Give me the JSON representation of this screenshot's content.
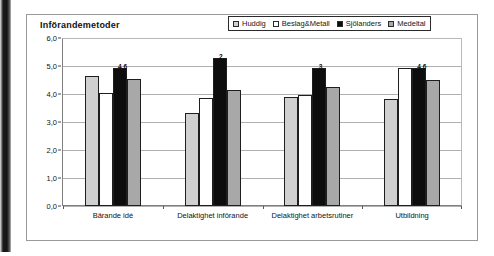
{
  "chart_data": {
    "type": "bar",
    "title": "Införandemetoder",
    "xlabel": "",
    "ylabel": "",
    "ylim": [
      0.0,
      6.0
    ],
    "ytick_step": 1.0,
    "grid": true,
    "legend_position": "top-right",
    "ytick_labels": [
      "6,0",
      "5,0",
      "4,0",
      "3,0",
      "2,0",
      "1,0",
      "0,0"
    ],
    "categories": [
      "Bärande idé",
      "Delaktighet införande",
      "Delaktighet arbetsrutiner",
      "Utbildning"
    ],
    "series": [
      {
        "name": "Huddig",
        "color": "#d0d0d0",
        "values": [
          4.7,
          3.35,
          3.95,
          3.85
        ],
        "labels": [
          "",
          "",
          "",
          ""
        ]
      },
      {
        "name": "Beslag&Metall",
        "color": "#ffffff",
        "values": [
          4.1,
          3.9,
          4.0,
          5.0
        ],
        "labels": [
          "",
          "",
          "",
          ""
        ]
      },
      {
        "name": "Sjölanders",
        "color": "#0d0d0d",
        "values": [
          5.0,
          5.35,
          5.0,
          5.0
        ],
        "labels": [
          "4,6",
          "2",
          "3",
          "4,6"
        ]
      },
      {
        "name": "Medeltal",
        "color": "#a8a8a8",
        "values": [
          4.6,
          4.2,
          4.3,
          4.55
        ],
        "labels": [
          "",
          "",
          "",
          ""
        ]
      }
    ]
  },
  "legend": {
    "items": [
      {
        "label": "Huddig",
        "color": "#d0d0d0"
      },
      {
        "label": "Beslag&Metall",
        "color": "#ffffff"
      },
      {
        "label": "Sjölanders",
        "color": "#0d0d0d"
      },
      {
        "label": "Medeltal",
        "color": "#a8a8a8"
      }
    ]
  }
}
